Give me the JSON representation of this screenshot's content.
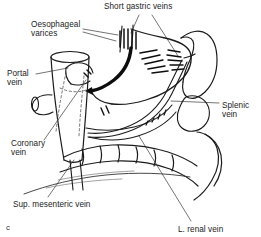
{
  "figure": {
    "letter": "c",
    "caption_labels": {
      "short_gastric_veins": "Short gastric veins",
      "oesophageal_varices_line1": "Oesophageal",
      "oesophageal_varices_line2": "varices",
      "portal_vein_line1": "Portal",
      "portal_vein_line2": "vein",
      "coronary_vein_line1": "Coronary",
      "coronary_vein_line2": "vein",
      "splenic_vein_line1": "Splenic",
      "splenic_vein_line2": "vein",
      "sup_mesenteric_vein": "Sup. mesenteric vein",
      "l_renal_vein": "L. renal vein"
    },
    "colors": {
      "ink": "#1b1b1b",
      "line": "#262626",
      "background": "#ffffff",
      "hidden_line": "#555555",
      "leader": "#3a3a3a"
    },
    "structures": [
      "oesophagus",
      "stomach",
      "spleen",
      "pancreas",
      "colon",
      "inferior-vena-cava",
      "portal-vein",
      "splenic-vein",
      "coronary-vein",
      "short-gastric-veins",
      "oesophageal-varices",
      "left-renal-vein",
      "superior-mesenteric-vein"
    ]
  }
}
